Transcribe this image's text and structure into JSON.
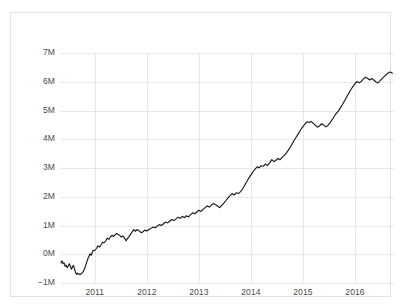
{
  "chart_data": {
    "type": "line",
    "title": "",
    "subtitle": "",
    "xlabel": "",
    "ylabel": "",
    "grid": true,
    "legend": false,
    "legend_position": "none",
    "line_color": "#1a1a1a",
    "grid_color": "#e8e8e8",
    "frame_color": "#e3e3e3",
    "background": "#ffffff",
    "ylim": [
      -1000000,
      7000000
    ],
    "yticks": [
      -1000000,
      0,
      1000000,
      2000000,
      3000000,
      4000000,
      5000000,
      6000000,
      7000000
    ],
    "ytick_labels": [
      "−1M",
      "0M",
      "1M",
      "2M",
      "3M",
      "4M",
      "5M",
      "6M",
      "7M"
    ],
    "xlim": [
      2010.35,
      2016.75
    ],
    "xticks": [
      2011,
      2012,
      2013,
      2014,
      2015,
      2016
    ],
    "xtick_labels": [
      "2011",
      "2012",
      "2013",
      "2014",
      "2015",
      "2016"
    ],
    "series": [
      {
        "name": "cumulative",
        "x": [
          2010.35,
          2010.37,
          2010.39,
          2010.41,
          2010.43,
          2010.45,
          2010.47,
          2010.49,
          2010.51,
          2010.53,
          2010.55,
          2010.57,
          2010.59,
          2010.61,
          2010.63,
          2010.65,
          2010.67,
          2010.69,
          2010.71,
          2010.73,
          2010.75,
          2010.77,
          2010.79,
          2010.81,
          2010.83,
          2010.85,
          2010.87,
          2010.89,
          2010.91,
          2010.93,
          2010.95,
          2010.97,
          2011.0,
          2011.03,
          2011.06,
          2011.09,
          2011.12,
          2011.15,
          2011.18,
          2011.21,
          2011.24,
          2011.27,
          2011.3,
          2011.33,
          2011.36,
          2011.39,
          2011.42,
          2011.45,
          2011.48,
          2011.51,
          2011.54,
          2011.57,
          2011.6,
          2011.63,
          2011.66,
          2011.69,
          2011.72,
          2011.75,
          2011.78,
          2011.81,
          2011.84,
          2011.87,
          2011.9,
          2011.93,
          2011.96,
          2012.0,
          2012.04,
          2012.08,
          2012.12,
          2012.16,
          2012.2,
          2012.24,
          2012.28,
          2012.32,
          2012.36,
          2012.4,
          2012.44,
          2012.48,
          2012.52,
          2012.56,
          2012.6,
          2012.64,
          2012.68,
          2012.72,
          2012.76,
          2012.8,
          2012.84,
          2012.88,
          2012.92,
          2012.96,
          2013.0,
          2013.04,
          2013.08,
          2013.12,
          2013.16,
          2013.2,
          2013.24,
          2013.28,
          2013.32,
          2013.36,
          2013.4,
          2013.44,
          2013.48,
          2013.52,
          2013.56,
          2013.6,
          2013.64,
          2013.68,
          2013.72,
          2013.76,
          2013.8,
          2013.84,
          2013.88,
          2013.92,
          2013.96,
          2014.0,
          2014.04,
          2014.08,
          2014.12,
          2014.16,
          2014.2,
          2014.24,
          2014.28,
          2014.32,
          2014.36,
          2014.4,
          2014.44,
          2014.48,
          2014.52,
          2014.56,
          2014.6,
          2014.64,
          2014.68,
          2014.72,
          2014.76,
          2014.8,
          2014.84,
          2014.88,
          2014.92,
          2014.96,
          2015.0,
          2015.04,
          2015.08,
          2015.12,
          2015.16,
          2015.2,
          2015.24,
          2015.28,
          2015.32,
          2015.36,
          2015.4,
          2015.44,
          2015.48,
          2015.52,
          2015.56,
          2015.6,
          2015.64,
          2015.68,
          2015.72,
          2015.76,
          2015.8,
          2015.84,
          2015.88,
          2015.92,
          2015.96,
          2016.0,
          2016.04,
          2016.08,
          2016.12,
          2016.16,
          2016.2,
          2016.24,
          2016.28,
          2016.32,
          2016.36,
          2016.4,
          2016.44,
          2016.48,
          2016.52,
          2016.56,
          2016.6,
          2016.64,
          2016.68,
          2016.72
        ],
        "values": [
          -300000,
          -230000,
          -330000,
          -300000,
          -420000,
          -380000,
          -470000,
          -410000,
          -330000,
          -420000,
          -520000,
          -440000,
          -390000,
          -520000,
          -640000,
          -700000,
          -660000,
          -690000,
          -700000,
          -690000,
          -660000,
          -620000,
          -560000,
          -470000,
          -350000,
          -240000,
          -140000,
          -60000,
          20000,
          -40000,
          60000,
          140000,
          130000,
          200000,
          290000,
          250000,
          330000,
          420000,
          400000,
          470000,
          560000,
          520000,
          600000,
          660000,
          620000,
          680000,
          720000,
          690000,
          650000,
          600000,
          640000,
          560000,
          470000,
          550000,
          620000,
          700000,
          790000,
          860000,
          800000,
          860000,
          830000,
          780000,
          750000,
          790000,
          840000,
          810000,
          860000,
          900000,
          950000,
          920000,
          980000,
          1030000,
          1000000,
          1060000,
          1120000,
          1090000,
          1150000,
          1210000,
          1170000,
          1230000,
          1290000,
          1250000,
          1320000,
          1270000,
          1340000,
          1300000,
          1380000,
          1440000,
          1410000,
          1470000,
          1530000,
          1490000,
          1560000,
          1620000,
          1680000,
          1640000,
          1710000,
          1770000,
          1720000,
          1680000,
          1620000,
          1700000,
          1780000,
          1870000,
          1960000,
          2040000,
          2110000,
          2060000,
          2140000,
          2110000,
          2180000,
          2270000,
          2400000,
          2520000,
          2650000,
          2760000,
          2870000,
          2960000,
          3040000,
          3010000,
          3080000,
          3060000,
          3140000,
          3090000,
          3180000,
          3290000,
          3220000,
          3270000,
          3330000,
          3290000,
          3370000,
          3440000,
          3520000,
          3620000,
          3730000,
          3860000,
          3990000,
          4100000,
          4220000,
          4340000,
          4440000,
          4530000,
          4610000,
          4580000,
          4620000,
          4550000,
          4480000,
          4420000,
          4470000,
          4540000,
          4490000,
          4430000,
          4480000,
          4570000,
          4680000,
          4790000,
          4900000,
          4980000,
          5090000,
          5210000,
          5340000,
          5470000,
          5600000,
          5720000,
          5830000,
          5930000,
          6010000,
          5960000,
          6010000,
          6090000,
          6160000,
          6120000,
          6060000,
          6110000,
          6060000,
          6000000,
          5960000,
          6030000,
          6110000,
          6180000,
          6250000,
          6310000,
          6340000,
          6300000
        ]
      }
    ]
  },
  "axes": {
    "y_ticks": [
      {
        "label": "7M",
        "value": 7000000
      },
      {
        "label": "6M",
        "value": 6000000
      },
      {
        "label": "5M",
        "value": 5000000
      },
      {
        "label": "4M",
        "value": 4000000
      },
      {
        "label": "3M",
        "value": 3000000
      },
      {
        "label": "2M",
        "value": 2000000
      },
      {
        "label": "1M",
        "value": 1000000
      },
      {
        "label": "0M",
        "value": 0
      },
      {
        "label": "−1M",
        "value": -1000000
      }
    ],
    "x_ticks": [
      {
        "label": "2011",
        "value": 2011
      },
      {
        "label": "2012",
        "value": 2012
      },
      {
        "label": "2013",
        "value": 2013
      },
      {
        "label": "2014",
        "value": 2014
      },
      {
        "label": "2015",
        "value": 2015
      },
      {
        "label": "2016",
        "value": 2016
      }
    ]
  }
}
